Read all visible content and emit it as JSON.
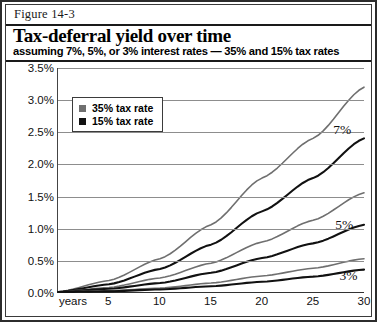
{
  "figure": {
    "label": "Figure 14-3",
    "title": "Tax-deferral yield over time",
    "subtitle": "assuming 7%, 5%, or 3% interest rates — 35% and 15% tax rates"
  },
  "legend": {
    "position": "top-left-inside",
    "items": [
      {
        "label": "35% tax rate",
        "color": "#6f6f6f",
        "marker": "square"
      },
      {
        "label": "15% tax rate",
        "color": "#111111",
        "marker": "square"
      }
    ]
  },
  "colors": {
    "grid": "#8d8d8d",
    "axis": "#333333",
    "tax35": "#6f6f6f",
    "tax15": "#111111",
    "frame": "#2c2c2c"
  },
  "annotations": [
    {
      "text": "7%",
      "x": 27.0,
      "y": 2.54
    },
    {
      "text": "5%",
      "x": 27.2,
      "y": 1.06
    },
    {
      "text": "3%",
      "x": 27.6,
      "y": 0.26
    }
  ],
  "chart_data": {
    "type": "line",
    "title": "Tax-deferral yield over time",
    "subtitle": "assuming 7%, 5%, or 3% interest rates — 35% and 15% tax rates",
    "xlabel": "years",
    "ylabel": "",
    "xlim": [
      0,
      30
    ],
    "ylim": [
      0.0,
      3.5
    ],
    "ytick_labels": [
      "0.0%",
      "0.5%",
      "1.0%",
      "1.5%",
      "2.0%",
      "2.5%",
      "3.0%",
      "3.5%"
    ],
    "ytick_values": [
      0.0,
      0.5,
      1.0,
      1.5,
      2.0,
      2.5,
      3.0,
      3.5
    ],
    "xtick_labels": [
      "years",
      "5",
      "10",
      "15",
      "20",
      "25",
      "30"
    ],
    "xtick_values": [
      0,
      5,
      10,
      15,
      20,
      25,
      30
    ],
    "grid": true,
    "legend_position": "upper left",
    "x": [
      0,
      5,
      10,
      15,
      20,
      25,
      30
    ],
    "series": [
      {
        "name": "7% interest, 35% tax rate",
        "interest_rate": 7,
        "tax_rate": 35,
        "color": "#6f6f6f",
        "values": [
          0.0,
          0.18,
          0.52,
          1.05,
          1.78,
          2.4,
          3.2
        ]
      },
      {
        "name": "7% interest, 15% tax rate",
        "interest_rate": 7,
        "tax_rate": 15,
        "color": "#111111",
        "values": [
          0.0,
          0.12,
          0.36,
          0.74,
          1.26,
          1.78,
          2.4
        ]
      },
      {
        "name": "5% interest, 35% tax rate",
        "interest_rate": 5,
        "tax_rate": 35,
        "color": "#6f6f6f",
        "values": [
          0.0,
          0.07,
          0.22,
          0.45,
          0.78,
          1.12,
          1.55
        ]
      },
      {
        "name": "5% interest, 15% tax rate",
        "interest_rate": 5,
        "tax_rate": 15,
        "color": "#111111",
        "values": [
          0.0,
          0.05,
          0.14,
          0.3,
          0.53,
          0.76,
          1.05
        ]
      },
      {
        "name": "3% interest, 35% tax rate",
        "interest_rate": 3,
        "tax_rate": 35,
        "color": "#6f6f6f",
        "values": [
          0.0,
          0.02,
          0.06,
          0.14,
          0.25,
          0.37,
          0.52
        ]
      },
      {
        "name": "3% interest, 15% tax rate",
        "interest_rate": 3,
        "tax_rate": 15,
        "color": "#111111",
        "values": [
          0.0,
          0.01,
          0.04,
          0.09,
          0.16,
          0.24,
          0.35
        ]
      }
    ]
  }
}
